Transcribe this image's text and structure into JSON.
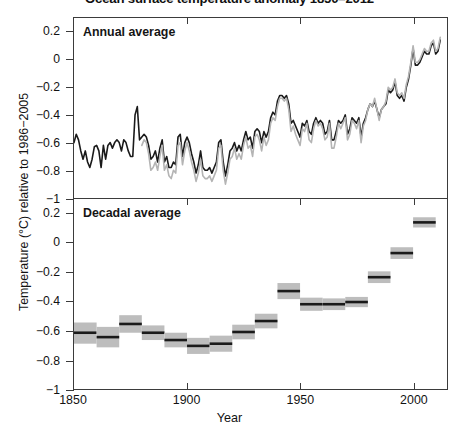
{
  "chart_data": {
    "type": "line",
    "title": "Ocean surface temperature anomaly 1850–2012",
    "xlabel": "Year",
    "ylabel": "Temperature (°C) relative to 1986−2005",
    "xlim": [
      1850,
      2015
    ],
    "ylim": [
      -1,
      0.3
    ],
    "xticks": [
      1850,
      1900,
      1950,
      2000
    ],
    "xtick_labels": [
      "1850",
      "1900",
      "1950",
      "2000"
    ],
    "yticks": [
      0.2,
      0,
      -0.2,
      -0.4,
      -0.6,
      -0.8,
      -1
    ],
    "ytick_labels": [
      "0.2",
      "0",
      "−0.2",
      "−0.4",
      "−0.6",
      "−0.8",
      "−1"
    ],
    "grid": false,
    "legend_position": "none",
    "colors": {
      "series_dark": "#1a1a1a",
      "series_light": "#b4b4b4",
      "uncertainty_band": "#bdbdbd",
      "axis": "#3b3b3b"
    },
    "panels": [
      {
        "key": "annual",
        "caption": "Annual average",
        "type": "line",
        "ylim": [
          -1,
          0.3
        ],
        "series": [
          {
            "name": "dataset-dark",
            "color": "#1a1a1a",
            "x": [
              1850,
              1851,
              1852,
              1853,
              1854,
              1855,
              1856,
              1857,
              1858,
              1859,
              1860,
              1861,
              1862,
              1863,
              1864,
              1865,
              1866,
              1867,
              1868,
              1869,
              1870,
              1871,
              1872,
              1873,
              1874,
              1875,
              1876,
              1877,
              1878,
              1879,
              1880,
              1881,
              1882,
              1883,
              1884,
              1885,
              1886,
              1887,
              1888,
              1889,
              1890,
              1891,
              1892,
              1893,
              1894,
              1895,
              1896,
              1897,
              1898,
              1899,
              1900,
              1901,
              1902,
              1903,
              1904,
              1905,
              1906,
              1907,
              1908,
              1909,
              1910,
              1911,
              1912,
              1913,
              1914,
              1915,
              1916,
              1917,
              1918,
              1919,
              1920,
              1921,
              1922,
              1923,
              1924,
              1925,
              1926,
              1927,
              1928,
              1929,
              1930,
              1931,
              1932,
              1933,
              1934,
              1935,
              1936,
              1937,
              1938,
              1939,
              1940,
              1941,
              1942,
              1943,
              1944,
              1945,
              1946,
              1947,
              1948,
              1949,
              1950,
              1951,
              1952,
              1953,
              1954,
              1955,
              1956,
              1957,
              1958,
              1959,
              1960,
              1961,
              1962,
              1963,
              1964,
              1965,
              1966,
              1967,
              1968,
              1969,
              1970,
              1971,
              1972,
              1973,
              1974,
              1975,
              1976,
              1977,
              1978,
              1979,
              1980,
              1981,
              1982,
              1983,
              1984,
              1985,
              1986,
              1987,
              1988,
              1989,
              1990,
              1991,
              1992,
              1993,
              1994,
              1995,
              1996,
              1997,
              1998,
              1999,
              2000,
              2001,
              2002,
              2003,
              2004,
              2005,
              2006,
              2007,
              2008,
              2009,
              2010,
              2011,
              2012
            ],
            "y": [
              -0.6,
              -0.54,
              -0.58,
              -0.66,
              -0.72,
              -0.66,
              -0.74,
              -0.78,
              -0.72,
              -0.63,
              -0.62,
              -0.66,
              -0.78,
              -0.62,
              -0.72,
              -0.62,
              -0.6,
              -0.64,
              -0.6,
              -0.58,
              -0.6,
              -0.66,
              -0.58,
              -0.6,
              -0.66,
              -0.7,
              -0.7,
              -0.4,
              -0.34,
              -0.58,
              -0.56,
              -0.54,
              -0.56,
              -0.62,
              -0.72,
              -0.7,
              -0.66,
              -0.74,
              -0.64,
              -0.58,
              -0.74,
              -0.7,
              -0.78,
              -0.78,
              -0.74,
              -0.76,
              -0.56,
              -0.54,
              -0.7,
              -0.6,
              -0.56,
              -0.6,
              -0.68,
              -0.74,
              -0.82,
              -0.76,
              -0.66,
              -0.78,
              -0.8,
              -0.8,
              -0.78,
              -0.82,
              -0.78,
              -0.74,
              -0.6,
              -0.58,
              -0.74,
              -0.84,
              -0.76,
              -0.66,
              -0.64,
              -0.6,
              -0.66,
              -0.62,
              -0.66,
              -0.58,
              -0.52,
              -0.58,
              -0.56,
              -0.64,
              -0.52,
              -0.5,
              -0.52,
              -0.6,
              -0.52,
              -0.56,
              -0.52,
              -0.42,
              -0.38,
              -0.4,
              -0.3,
              -0.26,
              -0.26,
              -0.28,
              -0.26,
              -0.32,
              -0.46,
              -0.44,
              -0.48,
              -0.52,
              -0.56,
              -0.46,
              -0.48,
              -0.44,
              -0.52,
              -0.54,
              -0.46,
              -0.42,
              -0.46,
              -0.44,
              -0.46,
              -0.54,
              -0.52,
              -0.44,
              -0.58,
              -0.58,
              -0.52,
              -0.44,
              -0.46,
              -0.44,
              -0.4,
              -0.54,
              -0.5,
              -0.42,
              -0.44,
              -0.46,
              -0.42,
              -0.56,
              -0.46,
              -0.42,
              -0.36,
              -0.32,
              -0.34,
              -0.3,
              -0.36,
              -0.42,
              -0.36,
              -0.34,
              -0.32,
              -0.22,
              -0.24,
              -0.22,
              -0.16,
              -0.26,
              -0.28,
              -0.26,
              -0.3,
              -0.2,
              -0.14,
              -0.04,
              0.08,
              -0.04,
              -0.04,
              -0.02,
              0.02,
              0.06,
              0.04,
              0.04,
              0.1,
              0.12,
              0.04,
              0.06,
              0.14,
              0.08,
              0.1
            ]
          },
          {
            "name": "dataset-light",
            "color": "#b4b4b4",
            "x": [
              1880,
              1881,
              1882,
              1883,
              1884,
              1885,
              1886,
              1887,
              1888,
              1889,
              1890,
              1891,
              1892,
              1893,
              1894,
              1895,
              1896,
              1897,
              1898,
              1899,
              1900,
              1901,
              1902,
              1903,
              1904,
              1905,
              1906,
              1907,
              1908,
              1909,
              1910,
              1911,
              1912,
              1913,
              1914,
              1915,
              1916,
              1917,
              1918,
              1919,
              1920,
              1921,
              1922,
              1923,
              1924,
              1925,
              1926,
              1927,
              1928,
              1929,
              1930,
              1931,
              1932,
              1933,
              1934,
              1935,
              1936,
              1937,
              1938,
              1939,
              1940,
              1941,
              1942,
              1943,
              1944,
              1945,
              1946,
              1947,
              1948,
              1949,
              1950,
              1951,
              1952,
              1953,
              1954,
              1955,
              1956,
              1957,
              1958,
              1959,
              1960,
              1961,
              1962,
              1963,
              1964,
              1965,
              1966,
              1967,
              1968,
              1969,
              1970,
              1971,
              1972,
              1973,
              1974,
              1975,
              1976,
              1977,
              1978,
              1979,
              1980,
              1981,
              1982,
              1983,
              1984,
              1985,
              1986,
              1987,
              1988,
              1989,
              1990,
              1991,
              1992,
              1993,
              1994,
              1995,
              1996,
              1997,
              1998,
              1999,
              2000,
              2001,
              2002,
              2003,
              2004,
              2005,
              2006,
              2007,
              2008,
              2009,
              2010,
              2011,
              2012
            ],
            "y": [
              -0.62,
              -0.58,
              -0.6,
              -0.68,
              -0.8,
              -0.78,
              -0.74,
              -0.8,
              -0.7,
              -0.62,
              -0.8,
              -0.76,
              -0.84,
              -0.86,
              -0.8,
              -0.82,
              -0.62,
              -0.6,
              -0.76,
              -0.66,
              -0.6,
              -0.66,
              -0.74,
              -0.8,
              -0.88,
              -0.82,
              -0.72,
              -0.84,
              -0.86,
              -0.86,
              -0.84,
              -0.88,
              -0.84,
              -0.8,
              -0.64,
              -0.62,
              -0.8,
              -0.9,
              -0.82,
              -0.72,
              -0.7,
              -0.64,
              -0.72,
              -0.68,
              -0.72,
              -0.62,
              -0.56,
              -0.64,
              -0.62,
              -0.7,
              -0.56,
              -0.54,
              -0.58,
              -0.66,
              -0.56,
              -0.62,
              -0.58,
              -0.46,
              -0.42,
              -0.44,
              -0.34,
              -0.28,
              -0.28,
              -0.3,
              -0.28,
              -0.36,
              -0.52,
              -0.48,
              -0.54,
              -0.58,
              -0.62,
              -0.5,
              -0.52,
              -0.46,
              -0.58,
              -0.6,
              -0.5,
              -0.44,
              -0.48,
              -0.46,
              -0.5,
              -0.58,
              -0.56,
              -0.46,
              -0.64,
              -0.64,
              -0.56,
              -0.46,
              -0.5,
              -0.46,
              -0.42,
              -0.58,
              -0.54,
              -0.44,
              -0.46,
              -0.5,
              -0.44,
              -0.6,
              -0.48,
              -0.44,
              -0.36,
              -0.32,
              -0.34,
              -0.28,
              -0.36,
              -0.44,
              -0.36,
              -0.34,
              -0.3,
              -0.2,
              -0.22,
              -0.2,
              -0.14,
              -0.24,
              -0.26,
              -0.24,
              -0.28,
              -0.18,
              -0.12,
              -0.02,
              0.1,
              -0.02,
              -0.02,
              0.0,
              0.04,
              0.08,
              0.06,
              0.06,
              0.12,
              0.14,
              0.06,
              0.08,
              0.16,
              0.1,
              0.12
            ]
          }
        ]
      },
      {
        "key": "decadal",
        "caption": "Decadal average",
        "type": "bar",
        "ylim": [
          -1,
          0.3
        ],
        "bars": [
          {
            "decade": "1850s",
            "x0": 1850,
            "x1": 1860,
            "value": -0.615,
            "low": -0.69,
            "high": -0.545
          },
          {
            "decade": "1860s",
            "x0": 1860,
            "x1": 1870,
            "value": -0.645,
            "low": -0.715,
            "high": -0.575
          },
          {
            "decade": "1870s",
            "x0": 1870,
            "x1": 1880,
            "value": -0.555,
            "low": -0.615,
            "high": -0.495
          },
          {
            "decade": "1880s",
            "x0": 1880,
            "x1": 1890,
            "value": -0.615,
            "low": -0.665,
            "high": -0.565
          },
          {
            "decade": "1890s",
            "x0": 1890,
            "x1": 1900,
            "value": -0.665,
            "low": -0.715,
            "high": -0.615
          },
          {
            "decade": "1900s",
            "x0": 1900,
            "x1": 1910,
            "value": -0.705,
            "low": -0.76,
            "high": -0.65
          },
          {
            "decade": "1910s",
            "x0": 1910,
            "x1": 1920,
            "value": -0.69,
            "low": -0.745,
            "high": -0.635
          },
          {
            "decade": "1920s",
            "x0": 1920,
            "x1": 1930,
            "value": -0.61,
            "low": -0.66,
            "high": -0.56
          },
          {
            "decade": "1930s",
            "x0": 1930,
            "x1": 1940,
            "value": -0.535,
            "low": -0.585,
            "high": -0.485
          },
          {
            "decade": "1940s",
            "x0": 1940,
            "x1": 1950,
            "value": -0.33,
            "low": -0.385,
            "high": -0.275
          },
          {
            "decade": "1950s",
            "x0": 1950,
            "x1": 1960,
            "value": -0.42,
            "low": -0.465,
            "high": -0.375
          },
          {
            "decade": "1960s",
            "x0": 1960,
            "x1": 1970,
            "value": -0.42,
            "low": -0.46,
            "high": -0.38
          },
          {
            "decade": "1970s",
            "x0": 1970,
            "x1": 1980,
            "value": -0.405,
            "low": -0.44,
            "high": -0.37
          },
          {
            "decade": "1980s",
            "x0": 1980,
            "x1": 1990,
            "value": -0.235,
            "low": -0.275,
            "high": -0.195
          },
          {
            "decade": "1990s",
            "x0": 1990,
            "x1": 2000,
            "value": -0.07,
            "low": -0.11,
            "high": -0.03
          },
          {
            "decade": "2000s",
            "x0": 2000,
            "x1": 2010,
            "value": 0.14,
            "low": 0.105,
            "high": 0.175
          }
        ]
      }
    ]
  }
}
